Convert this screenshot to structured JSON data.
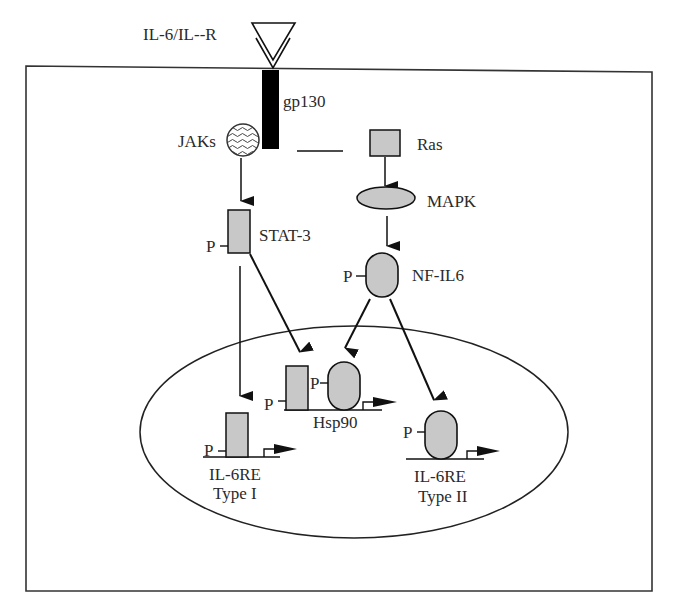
{
  "diagram": {
    "receptor_label": "IL-6/IL--R",
    "gp130_label": "gp130",
    "jaks_label": "JAKs",
    "ras_label": "Ras",
    "mapk_label": "MAPK",
    "stat3_label": "STAT-3",
    "nfil6_label": "NF-IL6",
    "phospho_label": "P",
    "hsp90_label": "Hsp90",
    "type1": {
      "line1": "IL-6RE",
      "line2": "Type I"
    },
    "type2": {
      "line1": "IL-6RE",
      "line2": "Type II"
    },
    "colors": {
      "line": "#1a1a1a",
      "protein_fill": "#c8c8c8",
      "receptor_bar": "#000000",
      "background": "#ffffff"
    }
  }
}
